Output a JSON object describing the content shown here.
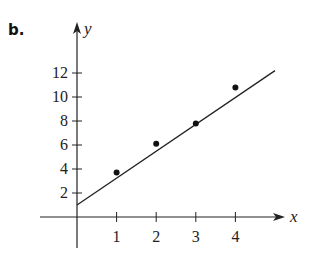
{
  "panel_label": "b.",
  "chart_data": {
    "type": "scatter",
    "title": "",
    "xlabel": "x",
    "ylabel": "y",
    "x_ticks": [
      1,
      2,
      3,
      4
    ],
    "y_ticks": [
      2,
      4,
      6,
      8,
      10,
      12
    ],
    "xlim": [
      -0.9,
      5.3
    ],
    "ylim": [
      -2.6,
      16
    ],
    "grid": false,
    "legend": null,
    "series": [
      {
        "name": "data points",
        "type": "scatter",
        "x": [
          1,
          2,
          3,
          4
        ],
        "y": [
          3.7,
          6.1,
          7.8,
          10.8
        ]
      },
      {
        "name": "fitted line",
        "type": "line",
        "x": [
          0,
          5
        ],
        "y": [
          1.0,
          12.2
        ]
      }
    ],
    "colors": {
      "axis": "#222222",
      "points": "#111111",
      "line": "#222222"
    }
  }
}
